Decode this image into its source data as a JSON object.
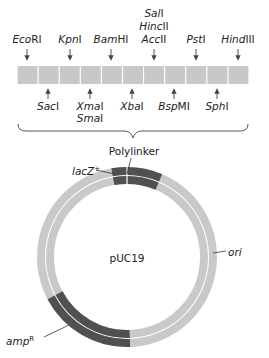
{
  "diagram": {
    "title": "pUC19",
    "polylinker_label": "Polylinker",
    "segments_count": 11,
    "colors": {
      "segment": "#c8c8c8",
      "ring_light": "#c9c9c9",
      "ring_dark": "#505050",
      "line": "#333333"
    },
    "top_sites": [
      {
        "italic": "Eco",
        "roman": "RI",
        "x": 27
      },
      {
        "italic": "Kpn",
        "roman": "I",
        "x": 70
      },
      {
        "italic": "Bam",
        "roman": "HI",
        "x": 111
      },
      {
        "lines": [
          {
            "italic": "Sal",
            "roman": "I"
          },
          {
            "italic": "Hinc",
            "roman": "II"
          },
          {
            "italic": "Acc",
            "roman": "II"
          }
        ],
        "x": 154
      },
      {
        "italic": "Pst",
        "roman": "I",
        "x": 196
      },
      {
        "italic": "Hind",
        "roman": "III",
        "x": 238
      }
    ],
    "bottom_sites": [
      {
        "italic": "Sac",
        "roman": "I",
        "x": 48
      },
      {
        "lines": [
          {
            "italic": "Xma",
            "roman": "I"
          },
          {
            "italic": "Sma",
            "roman": "I"
          }
        ],
        "x": 90
      },
      {
        "italic": "Xba",
        "roman": "I",
        "x": 132
      },
      {
        "italic": "Bsp",
        "roman": "MI",
        "x": 174
      },
      {
        "italic": "Sph",
        "roman": "I",
        "x": 217
      }
    ],
    "features": [
      {
        "name": "lacZ",
        "superscript": "+",
        "label": "lacZ+"
      },
      {
        "name": "ori",
        "label": "ori"
      },
      {
        "name": "amp",
        "superscript": "R",
        "label": "ampR"
      }
    ]
  }
}
